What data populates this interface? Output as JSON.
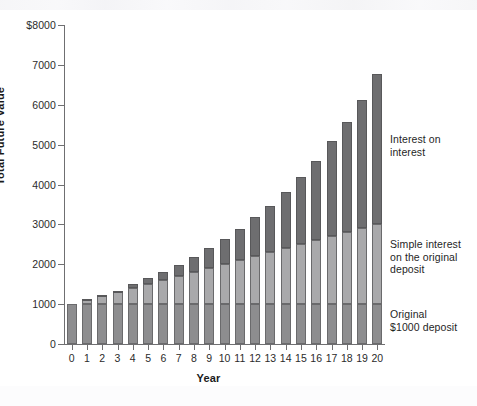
{
  "chart_data": {
    "type": "bar",
    "title": "",
    "subtitle": "",
    "xlabel": "Year",
    "ylabel": "Total Future Value",
    "stacked": true,
    "grid": false,
    "legend_position": "right-inline-annotations",
    "ylim": [
      0,
      8000
    ],
    "ytick_values": [
      0,
      1000,
      2000,
      3000,
      4000,
      5000,
      6000,
      7000,
      8000
    ],
    "ytick_labels": [
      "0",
      "1000",
      "2000",
      "3000",
      "4000",
      "5000",
      "6000",
      "7000",
      "$8000"
    ],
    "categories": [
      "0",
      "1",
      "2",
      "3",
      "4",
      "5",
      "6",
      "7",
      "8",
      "9",
      "10",
      "11",
      "12",
      "13",
      "14",
      "15",
      "16",
      "17",
      "18",
      "19",
      "20"
    ],
    "x": [
      0,
      1,
      2,
      3,
      4,
      5,
      6,
      7,
      8,
      9,
      10,
      11,
      12,
      13,
      14,
      15,
      16,
      17,
      18,
      19,
      20
    ],
    "series": [
      {
        "name": "Original $1000 deposit",
        "color": "#8d8d8f",
        "values": [
          1000,
          1000,
          1000,
          1000,
          1000,
          1000,
          1000,
          1000,
          1000,
          1000,
          1000,
          1000,
          1000,
          1000,
          1000,
          1000,
          1000,
          1000,
          1000,
          1000,
          1000
        ]
      },
      {
        "name": "Simple interest on the original deposit",
        "color": "#a9a9ab",
        "values": [
          0,
          100,
          200,
          300,
          400,
          500,
          600,
          700,
          800,
          900,
          1000,
          1100,
          1200,
          1300,
          1400,
          1500,
          1600,
          1700,
          1800,
          1900,
          2000
        ]
      },
      {
        "name": "Interest on interest",
        "color": "#6e6e70",
        "values": [
          0,
          0,
          10,
          31,
          64,
          111,
          172,
          251,
          349,
          469,
          614,
          785,
          987,
          1223,
          1495,
          1809,
          2167,
          2575,
          3038,
          3560,
          4150
        ]
      }
    ],
    "totals": [
      1000,
      1100,
      1210,
      1331,
      1464,
      1611,
      1772,
      1949,
      2144,
      2369,
      2614,
      2885,
      3187,
      3523,
      3895,
      4309,
      4767,
      5275,
      5838,
      6460,
      7150
    ],
    "totals_plotted": [
      1000,
      1130,
      1230,
      1340,
      1500,
      1650,
      1800,
      1980,
      2180,
      2400,
      2630,
      2890,
      3190,
      3470,
      3820,
      4190,
      4600,
      5080,
      5570,
      6120,
      6780
    ],
    "annotations": [
      {
        "id": "interest-on-interest",
        "text": "Interest on\ninterest"
      },
      {
        "id": "simple-interest",
        "text": "Simple interest\non the original\ndeposit"
      },
      {
        "id": "original-deposit",
        "text": "Original\n$1000 deposit"
      }
    ]
  },
  "axes": {
    "y_title": "Total Future Value",
    "x_title": "Year"
  },
  "colors": {
    "principal": "#8d8d8f",
    "simple": "#a9a9ab",
    "compound": "#6e6e70",
    "axis": "#6f6f71",
    "text": "#1f1f1f",
    "background": "#ffffff"
  }
}
